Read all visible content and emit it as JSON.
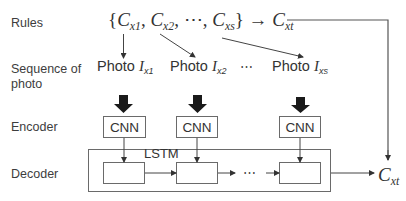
{
  "row_labels": {
    "rules": "Rules",
    "sequence_line1": "Sequence of",
    "sequence_line2": "photo",
    "encoder": "Encoder",
    "decoder": "Decoder"
  },
  "rules": {
    "open_brace": "{",
    "c": "C",
    "sub_x1": "x1",
    "sub_x2": "x2",
    "sub_xs": "xs",
    "comma": ",",
    "ellipsis": "⋯",
    "close_brace": "}",
    "arrow": "→",
    "target_sub": "xt"
  },
  "photos": [
    {
      "word": "Photo",
      "symbol": "I",
      "sub": "x1"
    },
    {
      "word": "Photo",
      "symbol": "I",
      "sub": "x2"
    },
    {
      "word": "Photo",
      "symbol": "I",
      "sub": "xs"
    }
  ],
  "photo_ellipsis": "⋯",
  "encoder": {
    "blocks": [
      "CNN",
      "CNN",
      "CNN"
    ]
  },
  "decoder": {
    "lstm_label": "LSTM",
    "ellipsis": "⋯",
    "output_symbol": "C",
    "output_sub": "xt"
  },
  "colors": {
    "line": "#444444",
    "box_border": "#6a6a6a",
    "thick_arrow": "#1a1a1a"
  }
}
